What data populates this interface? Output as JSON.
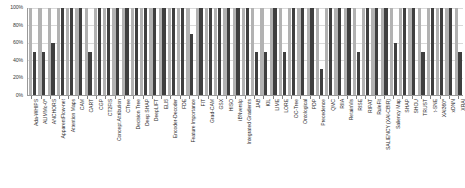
{
  "chart_data": {
    "type": "bar",
    "title": "",
    "subtitle": "",
    "xlabel": "",
    "ylabel": "",
    "ylim": [
      0,
      100
    ],
    "ytick_labels": [
      "0%",
      "20%",
      "40%",
      "60%",
      "80%",
      "100%"
    ],
    "ytick_values": [
      0,
      20,
      40,
      60,
      80,
      100
    ],
    "grid": true,
    "legend": false,
    "legend_position": "none",
    "categories": [
      "Ada-WHIPS",
      "ALIMMo-0*",
      "ANCHORS",
      "ApparentFlow-net",
      "Attention Maps",
      "CAM",
      "CART",
      "CGP",
      "CT2FIS",
      "Concept Attribution",
      "CTree",
      "Decision Tree",
      "Deep SHAP",
      "DeepLIFT",
      "ELI5",
      "Encoder-Decoder",
      "FDE",
      "Feature Importance",
      "FIT",
      "Grad-CAM",
      "GSX",
      "HISO",
      "iBNversIp",
      "Integrated Gradients",
      "JAB",
      "KIL",
      "LIME",
      "LORE",
      "OC-Tree",
      "Ontological",
      "PDP",
      "Precedence",
      "QMC",
      "RIIA",
      "RetainVis",
      "RISE",
      "RIPAT",
      "RuleFit",
      "SALIENCY (XAI-CBIR)",
      "Saliency Map",
      "SHAP",
      "SHOU",
      "TRUST",
      "t-SNE",
      "XAI360*",
      "xDNN",
      "XRAI"
    ],
    "series": [
      {
        "name": "Baseline",
        "color": "#b2b2b2",
        "values": [
          100,
          100,
          100,
          100,
          100,
          100,
          100,
          100,
          100,
          100,
          100,
          100,
          100,
          100,
          100,
          100,
          100,
          100,
          100,
          100,
          100,
          100,
          100,
          100,
          100,
          100,
          100,
          100,
          100,
          100,
          100,
          100,
          100,
          100,
          100,
          100,
          100,
          100,
          100,
          100,
          100,
          100,
          100,
          100,
          100,
          100,
          100
        ]
      },
      {
        "name": "Score",
        "color": "#3f3f3f",
        "values": [
          50,
          50,
          60,
          100,
          100,
          100,
          50,
          100,
          100,
          100,
          100,
          100,
          100,
          100,
          100,
          100,
          100,
          70,
          100,
          100,
          100,
          100,
          100,
          100,
          50,
          50,
          100,
          50,
          100,
          100,
          100,
          30,
          100,
          100,
          100,
          50,
          100,
          100,
          100,
          60,
          100,
          100,
          50,
          100,
          100,
          100,
          50
        ]
      }
    ]
  }
}
